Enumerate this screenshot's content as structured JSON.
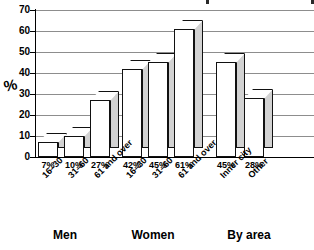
{
  "chart_data": {
    "type": "bar",
    "title": "",
    "xlabel": "",
    "ylabel": "%",
    "ylim": [
      0,
      70
    ],
    "ytick_step": 10,
    "yticks": [
      "70",
      "60",
      "50",
      "40",
      "30",
      "20",
      "10",
      "0"
    ],
    "grid": true,
    "legend": "none",
    "style": "3d-isometric",
    "groups": [
      {
        "label": "Men",
        "categories": [
          "16–30",
          "31–60",
          "61 and over"
        ],
        "values": [
          7,
          10,
          27
        ]
      },
      {
        "label": "Women",
        "categories": [
          "16–30",
          "31–60",
          "61 and over"
        ],
        "values": [
          42,
          45,
          61
        ]
      },
      {
        "label": "By area",
        "categories": [
          "Inner city",
          "Other"
        ],
        "values": [
          45,
          28
        ]
      }
    ],
    "categories": [
      "16–30",
      "31–60",
      "61 and over",
      "16–30",
      "31–60",
      "61 and over",
      "Inner city",
      "Other"
    ],
    "values": [
      7,
      10,
      27,
      42,
      45,
      61,
      45,
      28
    ],
    "value_labels": [
      "7%",
      "10%",
      "27%",
      "42%",
      "45%",
      "61%",
      "45%",
      "28%"
    ]
  },
  "axis": {
    "y_title": "%",
    "ticks": [
      {
        "label": "70",
        "value": 70
      },
      {
        "label": "60",
        "value": 60
      },
      {
        "label": "50",
        "value": 50
      },
      {
        "label": "40",
        "value": 40
      },
      {
        "label": "30",
        "value": 30
      },
      {
        "label": "20",
        "value": 20
      },
      {
        "label": "10",
        "value": 10
      },
      {
        "label": "0",
        "value": 0
      }
    ]
  },
  "colors": {
    "bar_front": "#ffffff",
    "bar_side": "#d2d2d2",
    "bar_top": "#ffffff",
    "outline": "#111111",
    "gridline": "#8d8d8d",
    "axis": "#000000",
    "text": "#000000",
    "background": "#ffffff"
  }
}
